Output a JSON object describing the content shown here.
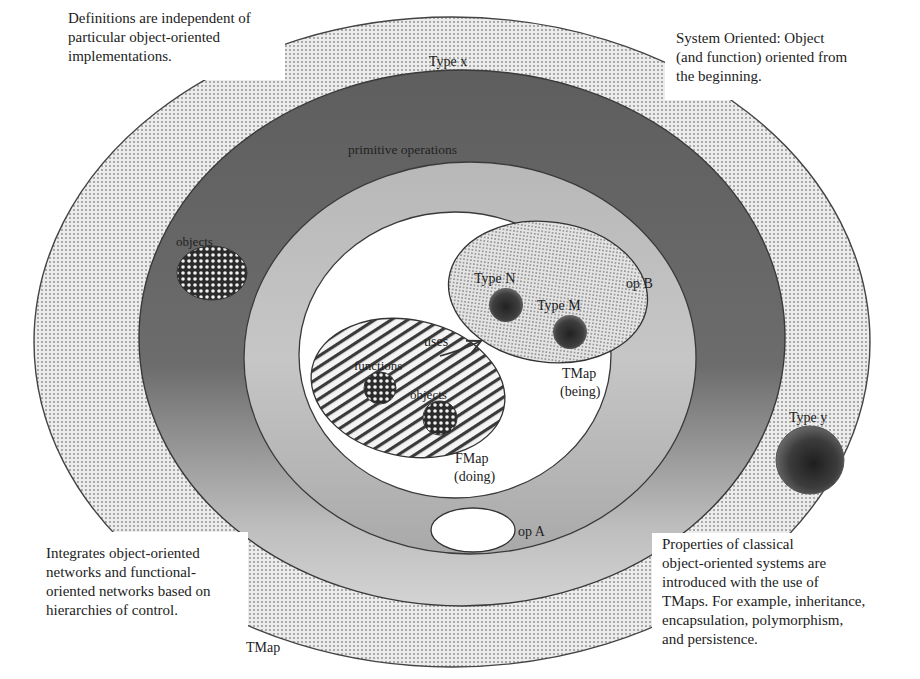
{
  "figure": {
    "colors": {
      "outer_ring_dots": "#d9d9d9",
      "primitive_ring": "#6e6e6e",
      "mid_ring": "#b5b5b5",
      "inner_fill": "#ffffff",
      "tmap_fill": "#dcdcdc",
      "dark_blob": "#3a3a3a",
      "outline": "#3c3c3c"
    }
  },
  "notes": {
    "top_left": "Definitions are independent of\nparticular object-oriented\nimplementations.",
    "top_right": "System Oriented: Object\n(and function) oriented from\nthe beginning.",
    "bottom_left": "Integrates object-oriented\nnetworks and functional-\noriented networks based on\nhierarchies of control.",
    "bottom_right": "Properties of classical\nobject-oriented systems are\nintroduced with the use of\nTMaps. For example, inheritance,\nencapsulation, polymorphism,\nand persistence."
  },
  "labels": {
    "type_x": "Type x",
    "primitive_operations": "primitive operations",
    "objects_outer": "objects",
    "type_n": "Type N",
    "type_m": "Type M",
    "op_b": "op B",
    "uses": "uses",
    "functions": "functions",
    "objects_inner": "objects",
    "tmap_being_1": "TMap",
    "tmap_being_2": "(being)",
    "fmap_doing_1": "FMap",
    "fmap_doing_2": "(doing)",
    "op_a": "op A",
    "type_y": "Type y",
    "tmap_bottom": "TMap"
  }
}
